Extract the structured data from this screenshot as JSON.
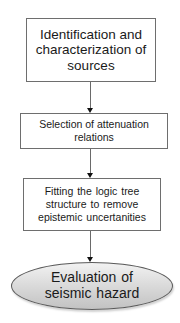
{
  "diagram": {
    "type": "flowchart",
    "direction": "top-to-bottom",
    "steps": [
      {
        "id": "step1",
        "shape": "rectangle",
        "label": "Identification and characterization of sources"
      },
      {
        "id": "step2",
        "shape": "rectangle",
        "label": "Selection of attenuation relations"
      },
      {
        "id": "step3",
        "shape": "rectangle",
        "label": "Fitting the  logic  tree structure to remove epistemic uncertanities"
      },
      {
        "id": "step4",
        "shape": "ellipse",
        "label": "Evaluation of seismic  hazard"
      }
    ],
    "connections": [
      {
        "from": "step1",
        "to": "step2"
      },
      {
        "from": "step2",
        "to": "step3"
      },
      {
        "from": "step3",
        "to": "step4"
      }
    ],
    "colors": {
      "box_border": "#6e6e6e",
      "box_fill": "#ffffff",
      "arrow_line": "#6a6a6a",
      "arrow_head": "#111111",
      "ellipse_fill_top": "#f2f2f2",
      "ellipse_fill_bottom": "#c2c2c2",
      "ellipse_border": "#5a5a5a",
      "text": "#1a1a1a"
    }
  }
}
